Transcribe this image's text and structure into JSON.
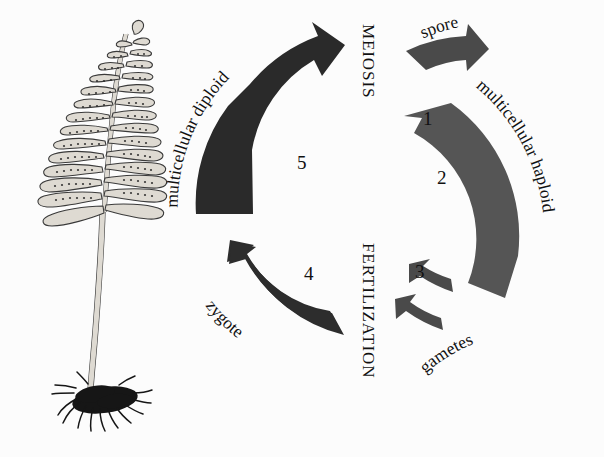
{
  "figure": {
    "background_color": "#fcfcfc"
  },
  "organism": {
    "name": "fern-sporophyte",
    "parts": {
      "frond": "frond",
      "stipe": "stipe",
      "rhizome": "rhizome-with-roots",
      "sori": "sori"
    }
  },
  "process_labels": {
    "meiosis": "MEIOSIS",
    "fertilization": "FERTILIZATION"
  },
  "stage_labels": {
    "spore": "spore",
    "multicellular_haploid": "multicellular haploid",
    "gametes": "gametes",
    "zygote": "zygote",
    "multicellular_diploid": "multicellular diploid"
  },
  "steps": [
    {
      "number": "1",
      "label": "spore",
      "arrow_color": "#4a4a4a"
    },
    {
      "number": "2",
      "label": "multicellular haploid",
      "arrow_color": "#555555"
    },
    {
      "number": "3",
      "label": "gametes",
      "arrow_color": "#4a4a4a"
    },
    {
      "number": "4",
      "label": "zygote",
      "arrow_color": "#2d2d2d"
    },
    {
      "number": "5",
      "label": "multicellular diploid",
      "arrow_color": "#2a2a2a"
    }
  ],
  "colors": {
    "dark_arrow": "#2a2a2a",
    "mid_arrow": "#555555",
    "text": "#111111",
    "plant_outline": "#3a3a3a",
    "plant_fill": "#d9d9d4",
    "rhizome": "#1a1a1a"
  }
}
